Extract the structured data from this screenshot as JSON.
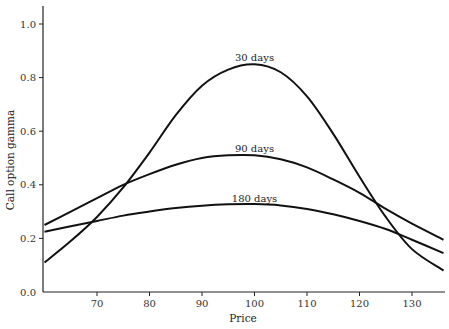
{
  "chart_data": {
    "type": "line",
    "title": "",
    "xlabel": "Price",
    "ylabel": "Call option gamma",
    "xlim": [
      60,
      136
    ],
    "ylim": [
      0.0,
      1.05
    ],
    "x_ticks": [
      70,
      80,
      90,
      100,
      110,
      120,
      130
    ],
    "y_ticks": [
      "0.0",
      "0.2",
      "0.4",
      "0.6",
      "0.8",
      "1.0"
    ],
    "grid": false,
    "legend": "inline labels above curve peaks",
    "x": [
      60,
      65,
      70,
      75,
      80,
      85,
      90,
      95,
      100,
      105,
      110,
      115,
      120,
      125,
      130,
      136
    ],
    "series": [
      {
        "name": "30 days",
        "label_at": [
          100,
          0.87
        ],
        "values": [
          0.11,
          0.19,
          0.28,
          0.39,
          0.52,
          0.66,
          0.77,
          0.83,
          0.85,
          0.82,
          0.73,
          0.59,
          0.43,
          0.28,
          0.16,
          0.08
        ]
      },
      {
        "name": "90 days",
        "label_at": [
          100,
          0.53
        ],
        "values": [
          0.25,
          0.3,
          0.35,
          0.4,
          0.44,
          0.475,
          0.5,
          0.51,
          0.51,
          0.495,
          0.465,
          0.42,
          0.37,
          0.31,
          0.255,
          0.195
        ]
      },
      {
        "name": "180 days",
        "label_at": [
          100,
          0.345
        ],
        "values": [
          0.225,
          0.245,
          0.265,
          0.285,
          0.3,
          0.313,
          0.322,
          0.327,
          0.328,
          0.323,
          0.31,
          0.29,
          0.265,
          0.235,
          0.195,
          0.145
        ]
      }
    ]
  }
}
